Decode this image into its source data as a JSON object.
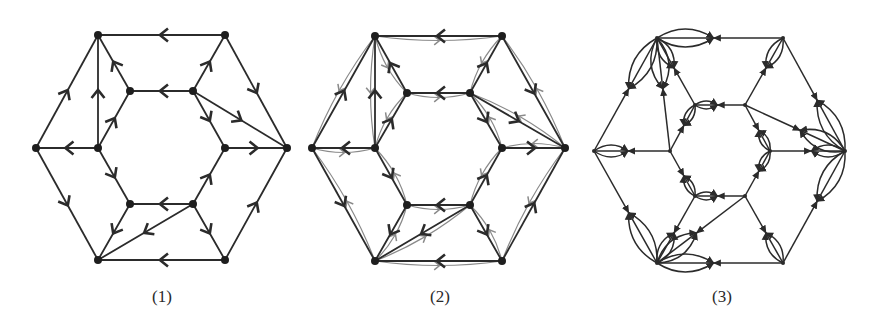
{
  "figure": {
    "background": "#ffffff",
    "edge_color": "#2b2b2b",
    "secondary_edge_color": "#8a8a8a",
    "panels": [
      {
        "label": "(1)",
        "description": "Directed graph drawn on a hexagonal prism layout (outer hexagon + inner hexagon + spokes + two diagonals)",
        "nodes": {
          "outer": [
            [
              98,
              35
            ],
            [
              225,
              35
            ],
            [
              287,
              148
            ],
            [
              225,
              260
            ],
            [
              98,
              260
            ],
            [
              36,
              148
            ]
          ],
          "inner": [
            [
              130,
              91
            ],
            [
              193,
              91
            ],
            [
              225,
              148
            ],
            [
              193,
              204
            ],
            [
              130,
              204
            ],
            [
              98,
              148
            ]
          ]
        },
        "edges": [
          {
            "from": [
              225,
              35
            ],
            "to": [
              98,
              35
            ]
          },
          {
            "from": [
              36,
              148
            ],
            "to": [
              98,
              35
            ]
          },
          {
            "from": [
              98,
              148
            ],
            "to": [
              98,
              35
            ]
          },
          {
            "from": [
              130,
              91
            ],
            "to": [
              98,
              35
            ]
          },
          {
            "from": [
              98,
              148
            ],
            "to": [
              130,
              91
            ]
          },
          {
            "from": [
              193,
              91
            ],
            "to": [
              130,
              91
            ]
          },
          {
            "from": [
              193,
              91
            ],
            "to": [
              225,
              35
            ]
          },
          {
            "from": [
              225,
              35
            ],
            "to": [
              287,
              148
            ]
          },
          {
            "from": [
              193,
              91
            ],
            "to": [
              287,
              148
            ]
          },
          {
            "from": [
              193,
              91
            ],
            "to": [
              225,
              148
            ]
          },
          {
            "from": [
              225,
              148
            ],
            "to": [
              287,
              148
            ]
          },
          {
            "from": [
              98,
              148
            ],
            "to": [
              36,
              148
            ]
          },
          {
            "from": [
              36,
              148
            ],
            "to": [
              98,
              260
            ]
          },
          {
            "from": [
              98,
              148
            ],
            "to": [
              130,
              204
            ]
          },
          {
            "from": [
              130,
              204
            ],
            "to": [
              98,
              260
            ]
          },
          {
            "from": [
              193,
              204
            ],
            "to": [
              98,
              260
            ]
          },
          {
            "from": [
              193,
              204
            ],
            "to": [
              130,
              204
            ]
          },
          {
            "from": [
              193,
              204
            ],
            "to": [
              225,
              148
            ]
          },
          {
            "from": [
              193,
              204
            ],
            "to": [
              225,
              260
            ]
          },
          {
            "from": [
              225,
              260
            ],
            "to": [
              98,
              260
            ]
          },
          {
            "from": [
              225,
              260
            ],
            "to": [
              287,
              148
            ]
          }
        ]
      },
      {
        "label": "(2)",
        "description": "Same graph as (1) with added gray curved reverse edges (dual-direction overlay)",
        "offset_x": 277,
        "nodes": {
          "outer": [
            [
              375,
              36
            ],
            [
              502,
              36
            ],
            [
              565,
              148
            ],
            [
              502,
              261
            ],
            [
              375,
              261
            ],
            [
              312,
              148
            ]
          ],
          "inner": [
            [
              407,
              93
            ],
            [
              470,
              93
            ],
            [
              502,
              148
            ],
            [
              470,
              205
            ],
            [
              407,
              205
            ],
            [
              375,
              148
            ]
          ]
        }
      },
      {
        "label": "(3)",
        "description": "Derived graph where each edge is replaced by a bundle of curved parallel edges forming lens/petal shapes with small arrowheads",
        "nodes": {
          "outer": [
            [
              657,
              38
            ],
            [
              783,
              38
            ],
            [
              845,
              151
            ],
            [
              783,
              263
            ],
            [
              657,
              263
            ],
            [
              594,
              151
            ]
          ],
          "inner": [
            [
              695,
              105
            ],
            [
              745,
              105
            ],
            [
              770,
              151
            ],
            [
              745,
              196
            ],
            [
              695,
              196
            ],
            [
              670,
              151
            ]
          ]
        }
      }
    ]
  }
}
